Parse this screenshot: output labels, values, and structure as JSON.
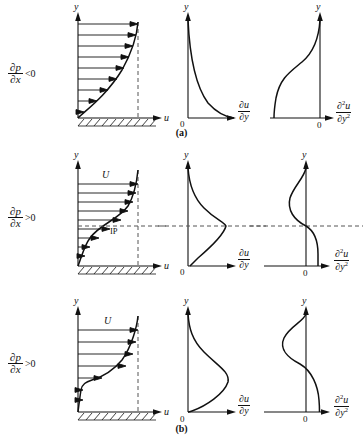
{
  "figure": {
    "stroke_color": "#111111",
    "dash_color": "#555555"
  },
  "symbols": {
    "partial": "∂",
    "y_axis": "y",
    "u_axis": "u",
    "freestream": "U",
    "zero": "0",
    "inflection_point": "IP",
    "p": "p",
    "x": "x",
    "u": "u",
    "y": "y",
    "sq": "2"
  },
  "rows": [
    {
      "id": "a",
      "caption": "(a)",
      "gradient": {
        "numerator": "∂p",
        "denominator": "∂x",
        "relation": "<0",
        "full": "∂p/∂x < 0"
      },
      "has_wall_hatching": true,
      "has_freestream_label": false,
      "freestream_label": "",
      "has_inflection_point": false,
      "inflection_label": "",
      "panels": [
        {
          "id": "velocity",
          "y_label": "y",
          "x_label": "u",
          "origin_label": "",
          "description": "Favorable pressure gradient: full, convex velocity profile, no inflection point"
        },
        {
          "id": "first-derivative",
          "y_label": "y",
          "x_num": "∂u",
          "x_den": "∂y",
          "origin_label": "0",
          "description": "du/dy monotonically decreasing from wall maximum to zero at edge"
        },
        {
          "id": "second-derivative",
          "y_label": "y",
          "x_num": "∂²u",
          "x_den": "∂y²",
          "origin_label": "0",
          "description": "d2u/dy2 negative everywhere, no sign change"
        }
      ]
    },
    {
      "id": "b",
      "caption": "(b)",
      "gradient": {
        "numerator": "∂p",
        "denominator": "∂x",
        "relation": ">0",
        "full": "∂p/∂x > 0"
      },
      "has_wall_hatching": true,
      "has_freestream_label": true,
      "freestream_label": "U",
      "has_inflection_point": true,
      "inflection_label": "IP",
      "panels": [
        {
          "id": "velocity",
          "y_label": "y",
          "x_label": "u",
          "origin_label": "",
          "description": "Adverse pressure gradient: S-shaped profile with inflection point IP"
        },
        {
          "id": "first-derivative",
          "y_label": "y",
          "x_num": "∂u",
          "x_den": "∂y",
          "origin_label": "0",
          "description": "du/dy has an interior maximum at the inflection point height"
        },
        {
          "id": "second-derivative",
          "y_label": "y",
          "x_num": "∂²u",
          "x_den": "∂y²",
          "origin_label": "0",
          "description": "d2u/dy2 crosses zero at the inflection point height"
        }
      ]
    },
    {
      "id": "c",
      "caption": "(c)",
      "gradient": {
        "numerator": "∂p",
        "denominator": "∂x",
        "relation": ">0",
        "full": "∂p/∂x > 0"
      },
      "has_wall_hatching": true,
      "has_freestream_label": true,
      "freestream_label": "U",
      "has_inflection_point": false,
      "inflection_label": "",
      "panels": [
        {
          "id": "velocity",
          "y_label": "y",
          "x_label": "u",
          "origin_label": "",
          "description": "Strong adverse gradient near separation: near-zero wall shear, strongly S-shaped"
        },
        {
          "id": "first-derivative",
          "y_label": "y",
          "x_num": "∂u",
          "x_den": "∂y",
          "origin_label": "0",
          "description": "du/dy approaches zero at the wall with a pronounced interior maximum"
        },
        {
          "id": "second-derivative",
          "y_label": "y",
          "x_num": "∂²u",
          "x_den": "∂y²",
          "origin_label": "0",
          "description": "d2u/dy2 positive at the wall, crossing zero higher in the layer"
        }
      ]
    }
  ]
}
